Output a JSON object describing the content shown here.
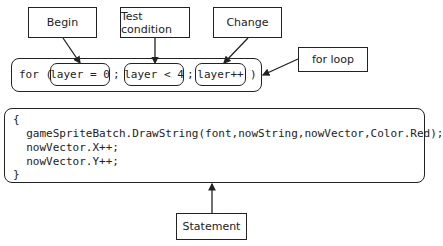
{
  "labels": {
    "begin": "Begin",
    "test_condition": "Test condition",
    "change": "Change",
    "for_loop": "for loop",
    "statement": "Statement"
  },
  "for_statement": {
    "keyword": "for (",
    "initializer": "layer = 0",
    "separator1": ";",
    "condition": "layer < 4",
    "separator2": ";",
    "iterator": "layer++",
    "close": ")"
  },
  "statement_block": {
    "lines": [
      "{",
      "  gameSpriteBatch.DrawString(font,nowString,nowVector,Color.Red);",
      "  nowVector.X++;",
      "  nowVector.Y++;",
      "}"
    ]
  },
  "colors": {
    "stroke": "#222222",
    "background": "#ffffff"
  }
}
